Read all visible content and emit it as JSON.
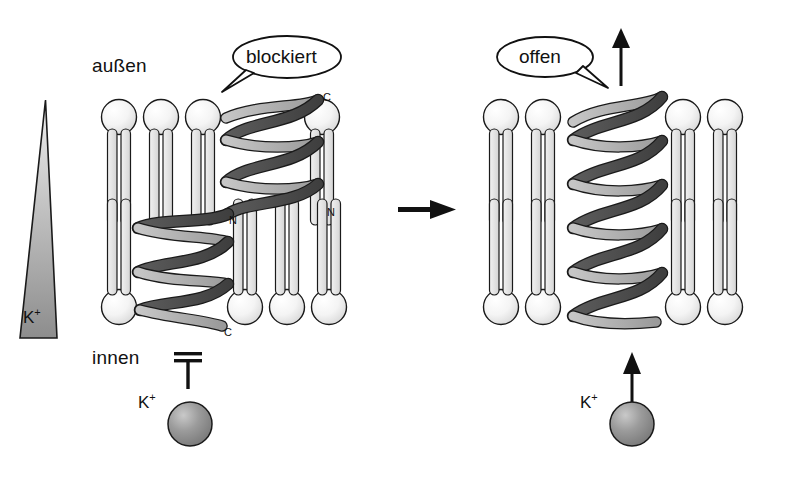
{
  "figure": {
    "kind": "membrane-channel-diagram",
    "background_color": "#ffffff"
  },
  "labels": {
    "outside": "außen",
    "inside": "innen"
  },
  "bubbles": [
    {
      "name": "blocked",
      "text": "blockiert",
      "tail": "down-left"
    },
    {
      "name": "open",
      "text": "offen",
      "tail": "down-right"
    }
  ],
  "gradient_wedge": {
    "ion": "K",
    "charge": "+",
    "label": "K+",
    "orientation": "narrow-top-wide-bottom",
    "fill_top": "#e9e9e9",
    "fill_bottom": "#8f8f8f"
  },
  "panels": [
    {
      "name": "blocked-panel",
      "state": "blockiert",
      "helices": [
        {
          "name": "outer-helix",
          "terminus_top": "C",
          "terminus_bottom": "N",
          "turns": 3,
          "leaflet": "outer"
        },
        {
          "name": "inner-helix",
          "terminus_top": "N",
          "terminus_bottom": "C",
          "turns": 3,
          "leaflet": "inner"
        }
      ],
      "lipid_counts": {
        "outer_leaflet_left": 3,
        "outer_leaflet_right": 1,
        "inner_leaflet_left": 1,
        "inner_leaflet_right": 3
      },
      "flux": {
        "permitted": false,
        "symbol": "blocked-bar",
        "arrow": "none"
      },
      "ion": {
        "label": "K+",
        "element": "K",
        "charge": "+",
        "color": "#8a8a8a"
      }
    },
    {
      "name": "open-panel",
      "state": "offen",
      "helices": [
        {
          "name": "pore-helix",
          "terminus_top": "",
          "terminus_bottom": "",
          "turns": 7,
          "leaflet": "spanning"
        }
      ],
      "lipid_counts": {
        "outer_leaflet_left": 2,
        "outer_leaflet_right": 2,
        "inner_leaflet_left": 2,
        "inner_leaflet_right": 2
      },
      "flux": {
        "permitted": true,
        "symbol": "up-arrow",
        "arrow": "up"
      },
      "ion": {
        "label": "K+",
        "element": "K",
        "charge": "+",
        "color": "#8a8a8a"
      }
    }
  ],
  "transition_arrow": {
    "name": "transition-arrow",
    "direction": "right"
  },
  "colors": {
    "stroke": "#1a1a1a",
    "lipid_head_light": "#ffffff",
    "lipid_head_shade": "#dcdcdc",
    "lipid_tail": "#e4e4e4",
    "helix_dark": "#4f4f4f",
    "helix_light": "#b5b5b5",
    "ion_sphere": "#8a8a8a"
  }
}
